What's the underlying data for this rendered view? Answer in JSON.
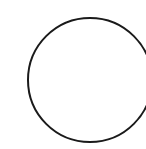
{
  "canvas": {
    "width": 146,
    "height": 149,
    "background": "#ffffff"
  },
  "shape": {
    "type": "circle-outline",
    "cx": 90,
    "cy": 80,
    "r": 62,
    "stroke": "#1a1a1a",
    "stroke_width": 2,
    "fill": "none"
  }
}
